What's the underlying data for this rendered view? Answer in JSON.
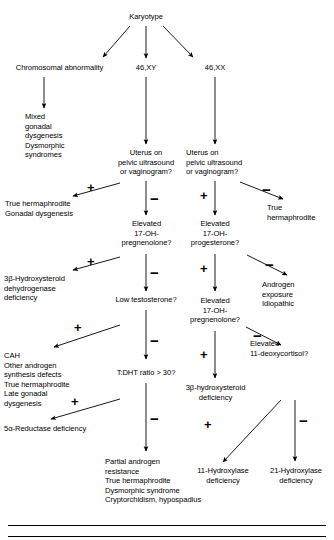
{
  "diagram": {
    "type": "flowchart",
    "root": "Karyotype",
    "nodes": {
      "karyotype": "Karyotype",
      "chromosomal_abnormality": "Chromosomal abnormality",
      "k46xy": "46,XY",
      "k46xx": "46,XX",
      "mixed_gonadal": "Mixed\n   gonadal\n   dysgenesis\nDysmorphic\n   syndromes",
      "uterus_xy": "Uterus on\npelvic ultrasound\nor vaginogram?",
      "uterus_xx": "Uterus on\n   pelvic ultrasound\n   or vaginogram?",
      "true_herm_gonadal": "True hermaphrodite\nGonadal dysgenesis",
      "true_herm_right": "True\n   hermaphrodite",
      "elevated_17oh_preg_left": "Elevated\n17-OH-\npregnenolone?",
      "elevated_17oh_prog": "Elevated\n17-OH-\nprogesterone?",
      "hsd_left": "3β-Hydroxysteroid\n   dehydrogenase\n   deficiency",
      "androgen_exposure": "Androgen\n   exposure\nIdiopathic",
      "low_testosterone": "Low testosterone?",
      "elevated_17oh_preg_right": "Elevated\n17-OH-\npregnenolone?",
      "cah_list": "CAH\nOther androgen\n   synthesis defects\nTrue hermaphrodite\nLate gonadal\n   dysgenesis",
      "elevated_11_deoxy": "Elevated\n   11-deoxycortisol?",
      "tdht_ratio": "T:DHT ratio > 30?",
      "hsd_right": "3β-hydroxysteroid\ndeficiency",
      "five_alpha": "5α-Reductase deficiency",
      "partial_androgen": "Partial androgen\n   resistance\nTrue hermaphrodite\nDysmorphic syndrome\nCryptorchidism, hypospadius",
      "hydroxylase_11": "11-Hydroxylase\ndeficiency",
      "hydroxylase_21": "21-Hydroxylase\ndeficiency"
    },
    "edge_labels": {
      "plus": "+",
      "minus": "−"
    },
    "signs": [
      {
        "id": "plus-uterus-xy",
        "label": "+"
      },
      {
        "id": "minus-uterus-xy",
        "label": "−"
      },
      {
        "id": "plus-uterus-xx",
        "label": "+"
      },
      {
        "id": "minus-uterus-xx",
        "label": "−"
      },
      {
        "id": "plus-17ohpreg-left",
        "label": "+"
      },
      {
        "id": "minus-17ohpreg-left",
        "label": "−"
      },
      {
        "id": "plus-17ohprog",
        "label": "+"
      },
      {
        "id": "minus-17ohprog",
        "label": "−"
      },
      {
        "id": "plus-low-testosterone",
        "label": "+"
      },
      {
        "id": "minus-low-testosterone",
        "label": "−"
      },
      {
        "id": "plus-17ohpreg-right",
        "label": "+"
      },
      {
        "id": "minus-17ohpreg-right",
        "label": "−"
      },
      {
        "id": "plus-tdht",
        "label": "+"
      },
      {
        "id": "minus-tdht",
        "label": "−"
      },
      {
        "id": "plus-11deoxy",
        "label": "+"
      },
      {
        "id": "minus-11deoxy",
        "label": "−"
      }
    ],
    "colors": {
      "line": "#000000",
      "text": "#000000",
      "background": "#ffffff"
    }
  }
}
